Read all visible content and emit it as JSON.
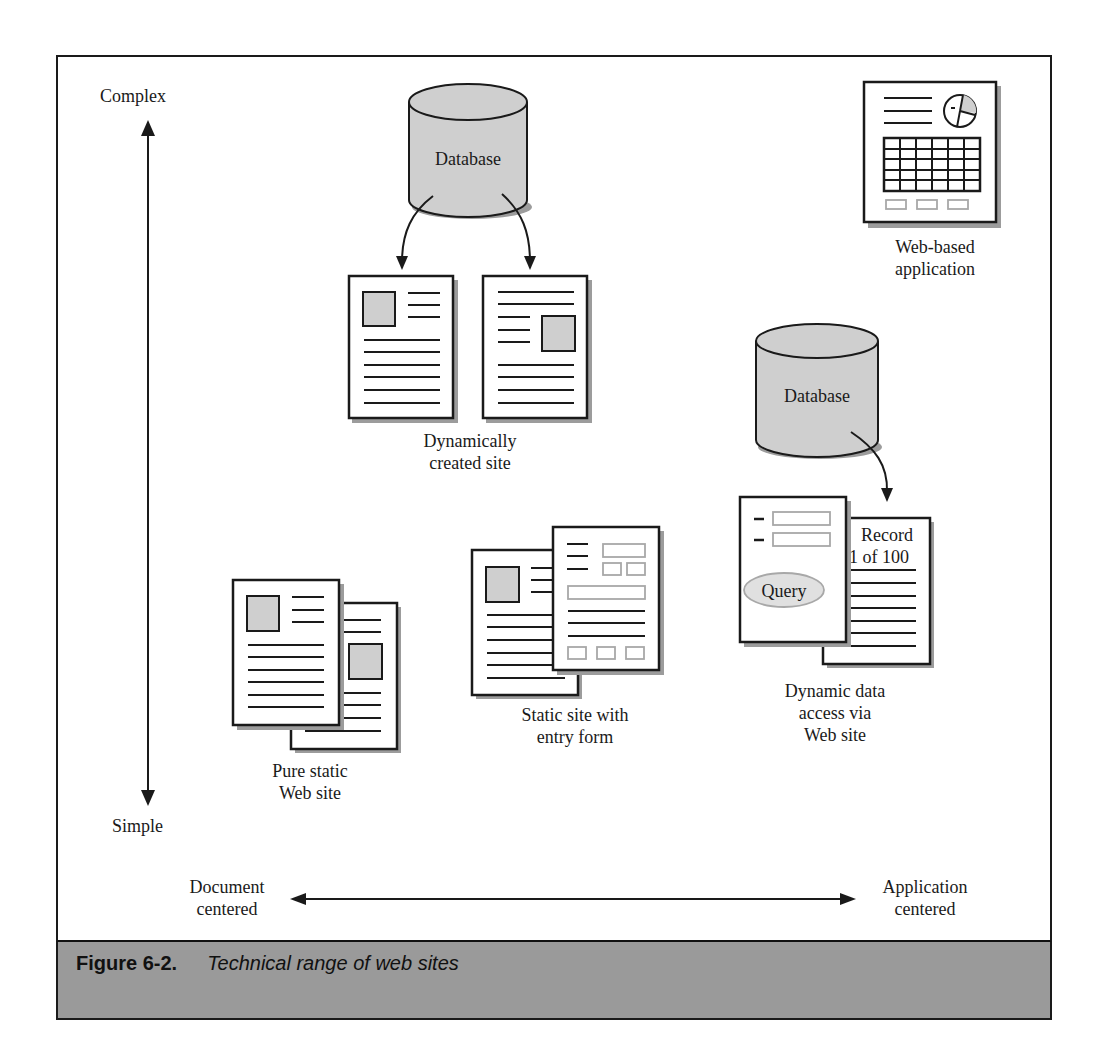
{
  "figure": {
    "number": "Figure 6-2.",
    "title": "Technical range of web sites"
  },
  "axes": {
    "vertical": {
      "top_label": "Complex",
      "bottom_label": "Simple"
    },
    "horizontal": {
      "left_label_line1": "Document",
      "left_label_line2": "centered",
      "right_label_line1": "Application",
      "right_label_line2": "centered"
    }
  },
  "nodes": {
    "database_top": {
      "label": "Database"
    },
    "database_right": {
      "label": "Database"
    },
    "dynamic_site": {
      "label_line1": "Dynamically",
      "label_line2": "created site"
    },
    "web_app": {
      "label_line1": "Web-based",
      "label_line2": "application"
    },
    "dynamic_data": {
      "label_line1": "Dynamic data",
      "label_line2": "access via",
      "label_line3": "Web site",
      "record_line1": "Record",
      "record_line2": "1 of 100",
      "query_label": "Query"
    },
    "static_form": {
      "label_line1": "Static site with",
      "label_line2": "entry form"
    },
    "pure_static": {
      "label_line1": "Pure static",
      "label_line2": "Web site"
    }
  },
  "colors": {
    "stroke": "#1a1a1a",
    "fill_gray": "#cfcfcf",
    "form_field": "#a8a8a8",
    "caption_band": "#9a9a9a",
    "shadow": "#9c9c9c"
  }
}
